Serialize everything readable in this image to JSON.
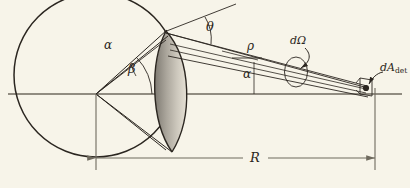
{
  "figure": {
    "kind": "optics-scattering-geometry-diagram",
    "background_color": "#f7f4e9",
    "ink_color": "#2b2620",
    "axis_color": "#6f6a5e",
    "crescent_fill": "#8c8780",
    "crescent_fill_light": "#b5b0a6"
  },
  "labels": {
    "theta": "θ",
    "alpha_lens": "α",
    "beta": "β",
    "rho": "ρ",
    "alpha_axis": "α",
    "d_omega": "dΩ",
    "dA_det_d": "dA",
    "dA_det_sub": "det",
    "R": "R"
  },
  "geometry": {
    "circle": {
      "cx": 96,
      "cy": 75,
      "r": 82
    },
    "vertex": {
      "x": 96,
      "y": 94
    },
    "lens_top": {
      "x": 166,
      "y": 31
    },
    "lens_bottom": {
      "x": 172,
      "y": 152
    },
    "detector_point": {
      "x": 368,
      "y": 88
    },
    "axis_y": 94,
    "dimension_line_y": 158,
    "dimension_left_x": 96,
    "dimension_right_x": 375,
    "solid_angle_ellipse": {
      "cx": 296,
      "cy": 71,
      "rx": 13,
      "ry": 16
    }
  },
  "annotations": {
    "theta_arc_label": "scattering angle theta at lens apex",
    "beta_arc_label": "angle beta between axis and ray to lens top",
    "alpha_arc_label": "small angular spread alpha of the ray bundle",
    "rho_label": "distance rho along the beam to the detector",
    "alpha_axis_label": "angle alpha between beam and horizontal axis",
    "d_omega_label": "differential solid angle element",
    "dA_det_label": "differential detector area element",
    "R_label": "distance R from vertex to detector plane"
  }
}
